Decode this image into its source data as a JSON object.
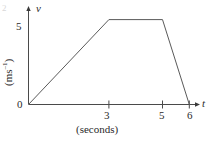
{
  "figure": {
    "background_color": "#ffffff",
    "line_color": "#5a5a5a",
    "axis_color": "#4a4a4a",
    "corner_artifact": "2"
  },
  "axes": {
    "y_axis_name": "v",
    "x_axis_name": "t",
    "y_unit_label_prefix": "(ms",
    "y_unit_label_exponent": "–1",
    "y_unit_label_suffix": ")",
    "x_caption": "(seconds)",
    "origin_label": "0",
    "y_tick_label_5": "5",
    "x_tick_label_3": "3",
    "x_tick_label_5": "5",
    "x_tick_label_6": "6"
  },
  "chart_data": {
    "type": "line",
    "title": "",
    "xlabel": "t (seconds)",
    "ylabel": "v (ms–1)",
    "x": [
      0,
      3,
      5,
      6
    ],
    "values": [
      0,
      5,
      5,
      0
    ],
    "series": [
      {
        "name": "velocity",
        "x": [
          0,
          3,
          5,
          6
        ],
        "values": [
          0,
          5,
          5,
          0
        ]
      }
    ],
    "xlim": [
      0,
      6.4
    ],
    "ylim": [
      0,
      5.8
    ],
    "xticks": [
      3,
      5,
      6
    ],
    "xtick_labels": [
      "3",
      "5",
      "6"
    ],
    "yticks": [
      0,
      5
    ],
    "ytick_labels": [
      "0",
      "5"
    ],
    "grid": false,
    "legend": false,
    "annotations": [
      "Velocity increases linearly from 0 to 5 ms–1 between t=0 s and t=3 s",
      "Velocity constant at 5 ms–1 between t=3 s and t=5 s",
      "Velocity decreases linearly from 5 ms–1 to 0 between t=5 s and t=6 s"
    ]
  }
}
